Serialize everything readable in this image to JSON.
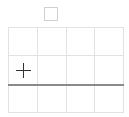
{
  "canvas": {
    "width": 129,
    "height": 117,
    "background": "#ffffff"
  },
  "top_square": {
    "icon": "square-outline-icon",
    "border_color": "#d0d0d0"
  },
  "grid": {
    "columns": 4,
    "rows": 3,
    "line_color": "#e2e2e2",
    "cells": [
      {
        "row": 0,
        "col": 0
      },
      {
        "row": 0,
        "col": 1
      },
      {
        "row": 0,
        "col": 2
      },
      {
        "row": 0,
        "col": 3
      },
      {
        "row": 1,
        "col": 0
      },
      {
        "row": 1,
        "col": 1
      },
      {
        "row": 1,
        "col": 2
      },
      {
        "row": 1,
        "col": 3
      },
      {
        "row": 2,
        "col": 0
      },
      {
        "row": 2,
        "col": 1
      },
      {
        "row": 2,
        "col": 2
      },
      {
        "row": 2,
        "col": 3
      }
    ]
  },
  "divider": {
    "color": "#8a8a8a"
  },
  "cursor": {
    "icon": "crosshair-plus-icon",
    "color": "#333333"
  }
}
